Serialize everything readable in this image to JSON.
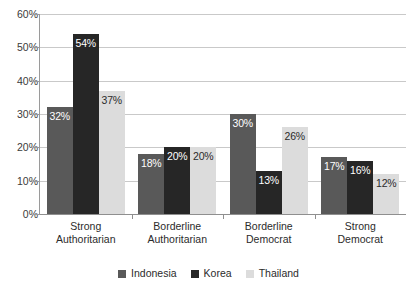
{
  "chart_data": {
    "type": "bar",
    "title": "",
    "subtitle": "",
    "xlabel": "",
    "ylabel": "",
    "ylim": [
      0,
      60
    ],
    "ytick_labels": [
      "0%",
      "10%",
      "20%",
      "30%",
      "40%",
      "50%",
      "60%"
    ],
    "ytick_values": [
      0,
      10,
      20,
      30,
      40,
      50,
      60
    ],
    "grid": true,
    "legend_position": "bottom",
    "categories": [
      "Strong Authoritarian",
      "Borderline Authoritarian",
      "Borderline Democrat",
      "Strong Democrat"
    ],
    "category_lines": [
      [
        "Strong",
        "Authoritarian"
      ],
      [
        "Borderline",
        "Authoritarian"
      ],
      [
        "Borderline",
        "Democrat"
      ],
      [
        "Strong",
        "Democrat"
      ]
    ],
    "series": [
      {
        "name": "Indonesia",
        "color": "#595959",
        "values": [
          32,
          18,
          30,
          17
        ],
        "labels": [
          "32%",
          "18%",
          "30%",
          "17%"
        ]
      },
      {
        "name": "Korea",
        "color": "#262626",
        "values": [
          54,
          20,
          13,
          16
        ],
        "labels": [
          "54%",
          "20%",
          "13%",
          "16%"
        ]
      },
      {
        "name": "Thailand",
        "color": "#dcdcdc",
        "values": [
          37,
          20,
          26,
          12
        ],
        "labels": [
          "37%",
          "20%",
          "26%",
          "12%"
        ]
      }
    ]
  },
  "legend": {
    "items": [
      {
        "label": "Indonesia",
        "color": "#595959"
      },
      {
        "label": "Korea",
        "color": "#262626"
      },
      {
        "label": "Thailand",
        "color": "#dcdcdc"
      }
    ]
  }
}
